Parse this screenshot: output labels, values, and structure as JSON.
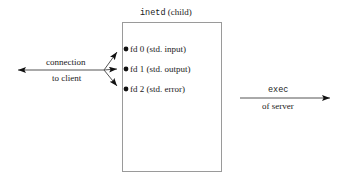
{
  "figure": {
    "background_color": "#ffffff",
    "line_color": "#444444",
    "box_border_color": "#9a9a9a",
    "text_color": "#1a1a1a"
  },
  "box": {
    "title_mono": "inetd",
    "title_serif": " (child)",
    "x": 122,
    "y": 22,
    "width": 100,
    "height": 150
  },
  "descriptors": [
    {
      "name": "fd-0",
      "label": "fd 0 (std. input)",
      "dot_x": 126,
      "dot_y": 49
    },
    {
      "name": "fd-1",
      "label": "fd 1 (std. output)",
      "dot_x": 126,
      "dot_y": 69
    },
    {
      "name": "fd-2",
      "label": "fd 2 (std. error)",
      "dot_x": 126,
      "dot_y": 89
    }
  ],
  "connection": {
    "line_1": "connection",
    "line_2": "to client",
    "arrow_tip_x": 8,
    "line_y": 70,
    "fan_x": 104
  },
  "exec": {
    "line_1_mono": "exec",
    "line_2": "of server",
    "start_x": 240,
    "end_x": 338,
    "line_y": 98
  }
}
